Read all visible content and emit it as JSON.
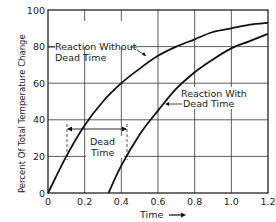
{
  "chart_data": {
    "type": "line",
    "title": "",
    "xlabel": "Time",
    "xlabel_arrow": "→",
    "ylabel": "Percent Of Total Temperature Change",
    "xlim": [
      0,
      1.2
    ],
    "ylim": [
      0,
      100
    ],
    "x_ticks": [
      "0",
      "0.2",
      "0.4",
      "0.6",
      "0.8",
      "1.0",
      "1.2"
    ],
    "y_ticks": [
      "0",
      "20",
      "40",
      "60",
      "80",
      "100"
    ],
    "grid": true,
    "series": [
      {
        "name": "Reaction Without Dead Time",
        "x": [
          0,
          0.1,
          0.2,
          0.3,
          0.4,
          0.5,
          0.6,
          0.7,
          0.8,
          0.9,
          1.0,
          1.1,
          1.2
        ],
        "values": [
          0,
          20,
          37,
          50,
          60,
          68,
          75,
          80,
          84,
          88,
          90,
          92,
          93
        ]
      },
      {
        "name": "Reaction With Dead Time",
        "x": [
          0.33,
          0.4,
          0.5,
          0.6,
          0.7,
          0.8,
          0.9,
          1.0,
          1.1,
          1.2
        ],
        "values": [
          0,
          15,
          32,
          45,
          57,
          66,
          73,
          79,
          83,
          87
        ]
      }
    ],
    "annotations": [
      {
        "text": "Reaction Without Dead Time",
        "points_to": "Reaction Without Dead Time"
      },
      {
        "text": "Reaction With Dead Time",
        "points_to": "Reaction With Dead Time"
      },
      {
        "text": "Dead Time",
        "span_x": [
          0.1,
          0.43
        ],
        "y": 35
      }
    ]
  },
  "labels": {
    "ylabel": "Percent Of Total Temperature Change",
    "xlabel": "Time",
    "without_line1": "Reaction Without",
    "without_line2": "Dead Time",
    "with_line1": "Reaction With",
    "with_line2": "Dead Time",
    "dead_line1": "Dead",
    "dead_line2": "Time"
  }
}
